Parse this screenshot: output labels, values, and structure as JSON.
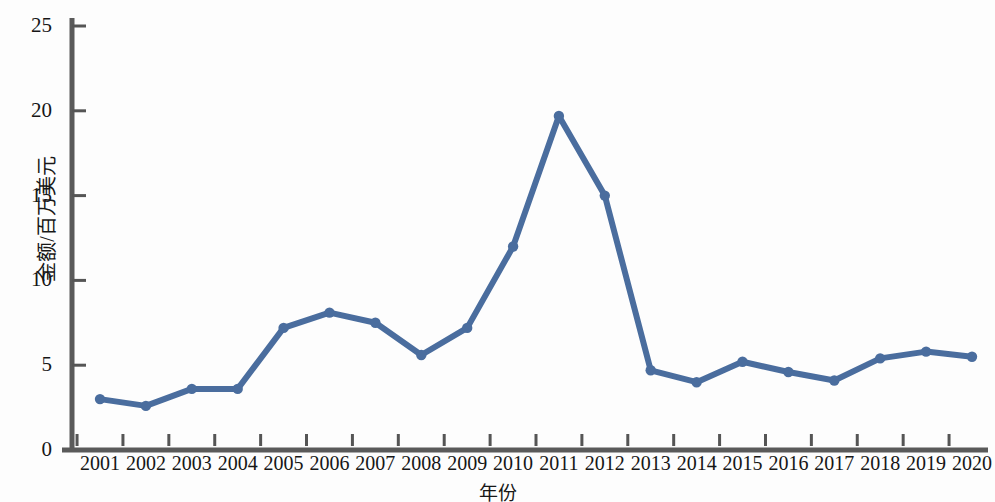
{
  "chart_data": {
    "type": "line",
    "title": "",
    "xlabel": "年份",
    "ylabel": "金额/百万美元",
    "categories": [
      "2001",
      "2002",
      "2003",
      "2004",
      "2005",
      "2006",
      "2007",
      "2008",
      "2009",
      "2010",
      "2011",
      "2012",
      "2013",
      "2014",
      "2015",
      "2016",
      "2017",
      "2018",
      "2019",
      "2020"
    ],
    "values": [
      3.0,
      2.6,
      3.6,
      3.6,
      7.2,
      8.1,
      7.5,
      5.6,
      7.2,
      12.0,
      19.7,
      15.0,
      4.7,
      4.0,
      5.2,
      4.6,
      4.1,
      5.4,
      5.8,
      5.5
    ],
    "series": [
      {
        "name": "金额",
        "values": [
          3.0,
          2.6,
          3.6,
          3.6,
          7.2,
          8.1,
          7.5,
          5.6,
          7.2,
          12.0,
          19.7,
          15.0,
          4.7,
          4.0,
          5.2,
          4.6,
          4.1,
          5.4,
          5.8,
          5.5
        ]
      }
    ],
    "ylim": [
      0,
      25
    ],
    "y_ticks": [
      0,
      5,
      10,
      15,
      20,
      25
    ],
    "y_tick_labels": [
      "0",
      "5",
      "10",
      "15",
      "20",
      "25"
    ],
    "grid": false,
    "legend": false,
    "legend_position": "none",
    "markers": true,
    "line_color": "#4a6d9e",
    "marker_color": "#4a6d9e",
    "axis_color": "#555555",
    "background_color": "#fdfdfd"
  }
}
